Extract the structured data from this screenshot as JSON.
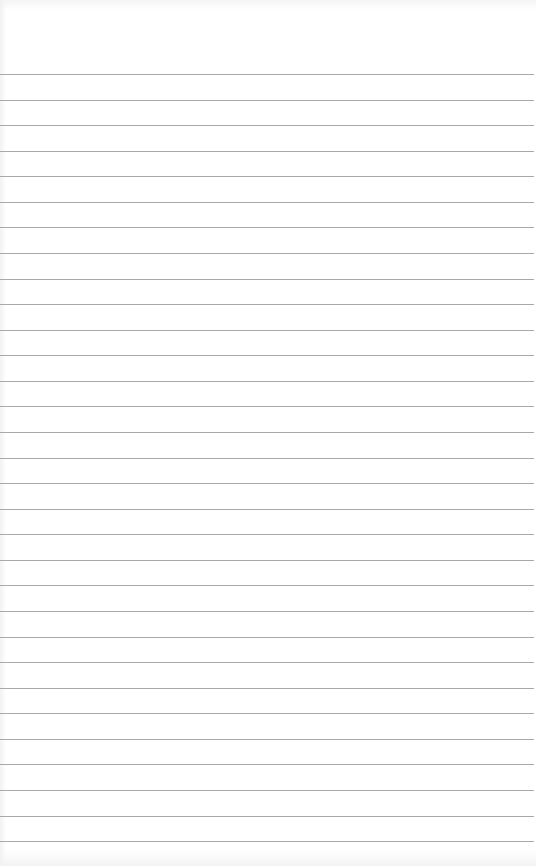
{
  "page": {
    "type": "lined-paper",
    "background_color": "#ffffff",
    "rule_color": "#a9a9a9",
    "first_rule_y": 74,
    "rule_spacing": 25.57,
    "rule_count": 31
  }
}
